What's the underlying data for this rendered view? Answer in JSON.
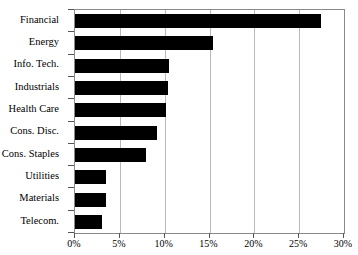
{
  "chart_data": {
    "type": "bar",
    "orientation": "horizontal",
    "title": "",
    "subtitle": "",
    "xlabel": "",
    "ylabel": "",
    "categories": [
      "Financial",
      "Energy",
      "Info. Tech.",
      "Industrials",
      "Health Care",
      "Cons. Disc.",
      "Cons. Staples",
      "Utilities",
      "Materials",
      "Telecom."
    ],
    "values": [
      27.4,
      15.4,
      10.5,
      10.4,
      10.2,
      9.1,
      7.9,
      3.5,
      3.5,
      3.0
    ],
    "value_unit": "%",
    "xlim": [
      0,
      30
    ],
    "xticks": [
      0,
      5,
      10,
      15,
      20,
      25,
      30
    ],
    "xtick_labels": [
      "0%",
      "5%",
      "10%",
      "15%",
      "20%",
      "25%",
      "30%"
    ],
    "grid": true,
    "grid_axis": "x",
    "legend": false,
    "legend_position": "none",
    "bar_color": "#000000",
    "grid_color": "#b9b9b9",
    "axis_color": "#8a8a8a",
    "background_color": "#ffffff"
  }
}
